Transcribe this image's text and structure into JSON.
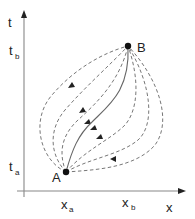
{
  "diagram": {
    "type": "path-integral-trajectories",
    "axes": {
      "y_label": "t",
      "x_label": "x",
      "y_ticks": [
        {
          "label": "t",
          "sub": "b"
        },
        {
          "label": "t",
          "sub": "a"
        }
      ],
      "x_ticks": [
        {
          "label": "x",
          "sub": "a"
        },
        {
          "label": "x",
          "sub": "b"
        }
      ]
    },
    "points": [
      {
        "label": "A",
        "role": "start",
        "coord": "(x_a, t_a)"
      },
      {
        "label": "B",
        "role": "end",
        "coord": "(x_b, t_b)"
      }
    ],
    "paths": {
      "classical": "solid",
      "alternatives": "dashed",
      "count_dashed": 6
    },
    "colors": {
      "axis": "#888888",
      "dashed": "#777777",
      "solid": "#666666",
      "points": "#111111",
      "text": "#222222"
    }
  }
}
